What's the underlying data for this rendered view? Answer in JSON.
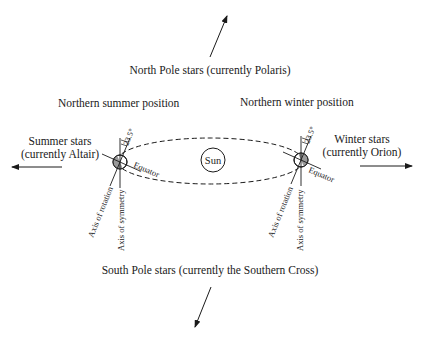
{
  "labels": {
    "north_pole": "North Pole stars (currently Polaris)",
    "south_pole": "South Pole stars (currently the Southern Cross)",
    "summer_position": "Northern summer position",
    "winter_position": "Northern winter position",
    "summer_stars_line1": "Summer stars",
    "summer_stars_line2": "(currently Altair)",
    "winter_stars_line1": "Winter stars",
    "winter_stars_line2": "(currently Orion)",
    "sun": "Sun",
    "equator": "Equator",
    "tilt_angle": "23.5°",
    "axis_rotation": "Axis of rotation",
    "axis_symmetry": "Axis of symmetry"
  },
  "colors": {
    "ink": "#1a1a1a",
    "earth_shade": "#9a9a9a"
  }
}
